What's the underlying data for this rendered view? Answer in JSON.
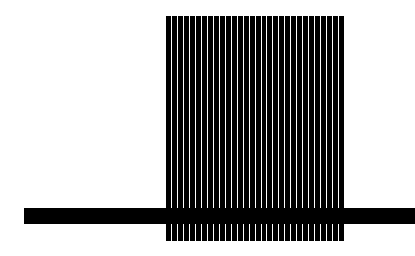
{
  "figure": {
    "stripe_count": 30,
    "colors": {
      "foreground": "#000000",
      "background": "#ffffff"
    }
  }
}
